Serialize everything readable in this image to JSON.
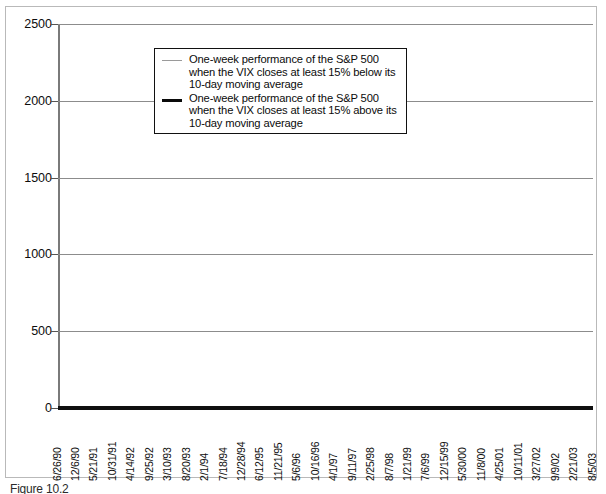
{
  "figure": {
    "caption": "Figure 10.2"
  },
  "legend": {
    "position": "top-left-inside",
    "items": [
      {
        "key": "below",
        "style": "thin-gray",
        "label": "One-week performance of the S&P 500 when the VIX closes at least 15% below its 10-day moving average",
        "lines": [
          "One-week performance of the S&P 500",
          "when the VIX closes at least 15% below its",
          "10-day moving average"
        ]
      },
      {
        "key": "above",
        "style": "thick-black",
        "label": "One-week performance of the S&P 500 when the VIX closes at least 15% above its 10-day moving average",
        "lines": [
          "One-week performance of the S&P 500",
          "when the VIX closes at least 15% above its",
          "10-day moving average"
        ]
      }
    ]
  },
  "colors": {
    "series_above": "#0a0a0a",
    "series_below": "#9a9a9a",
    "gridline": "#8c8c8c",
    "axis": "#101010",
    "background": "#ffffff"
  },
  "chart_data": {
    "type": "line",
    "title": "",
    "subtitle": "",
    "xlabel": "",
    "ylabel": "",
    "ylim": [
      0,
      2500
    ],
    "yticks": [
      0,
      500,
      1000,
      1500,
      2000,
      2500
    ],
    "ytick_labels": [
      "0",
      "500",
      "1000",
      "1500",
      "2000",
      "2500"
    ],
    "grid": true,
    "grid_axis": "y",
    "legend_position": "upper left (inside plot)",
    "x_tick_labels": [
      "6/26/90",
      "12/6/90",
      "5/21/91",
      "10/31/91",
      "4/14/92",
      "9/25/92",
      "3/10/93",
      "8/20/93",
      "2/1/94",
      "7/18/94",
      "12/28/94",
      "6/12/95",
      "11/21/95",
      "5/6/96",
      "10/16/96",
      "4/1/97",
      "9/11/97",
      "2/25/98",
      "8/7/98",
      "1/21/99",
      "7/6/99",
      "12/15/99",
      "5/30/00",
      "11/8/00",
      "4/25/01",
      "10/11/01",
      "3/27/02",
      "9/9/02",
      "2/21/03",
      "8/5/03"
    ],
    "series": [
      {
        "name": "One-week performance of the S&P 500 when the VIX closes at least 15% above its 10-day moving average",
        "style": "thick-black",
        "color": "#0a0a0a",
        "line_width": 2.4,
        "shape": "step",
        "start_value": 1000,
        "end_value": 2180,
        "max_value": 2255,
        "min_value": 975,
        "x": [
          0.0,
          0.8,
          1.2,
          1.6,
          2.0,
          2.4,
          2.8,
          3.2,
          3.6,
          4.0,
          4.6,
          5.2,
          5.8,
          6.4,
          7.0,
          7.6,
          8.2,
          8.8,
          9.4,
          10.0,
          10.6,
          11.2,
          11.8,
          12.4,
          13.0,
          13.6,
          14.2,
          14.8,
          15.4,
          16.0,
          16.4,
          16.8,
          17.0,
          17.2,
          17.4,
          17.6,
          17.8,
          18.0,
          18.2,
          18.5,
          19.0,
          19.5,
          20.0,
          20.5,
          21.0,
          21.5,
          22.0,
          22.5,
          23.0,
          23.4,
          23.6,
          23.8,
          24.0,
          24.4,
          25.0,
          25.6,
          26.0,
          26.2,
          26.4,
          26.6,
          27.0,
          27.6,
          28.2,
          28.8,
          29.0
        ],
        "y": [
          1000,
          1000,
          1045,
          1075,
          1090,
          1110,
          1140,
          1225,
          1235,
          1240,
          1300,
          1310,
          1315,
          1370,
          1380,
          1400,
          1440,
          1470,
          1500,
          1525,
          1545,
          1575,
          1585,
          1600,
          1610,
          1625,
          1640,
          1665,
          1680,
          1700,
          1790,
          1900,
          2000,
          2030,
          1975,
          2040,
          1860,
          2010,
          1900,
          1950,
          1960,
          1965,
          1990,
          2010,
          2050,
          2080,
          2120,
          2130,
          2160,
          2190,
          2230,
          2255,
          2230,
          2230,
          1860,
          1930,
          1925,
          1890,
          1750,
          1990,
          2040,
          2090,
          2105,
          2160,
          2180
        ]
      },
      {
        "name": "One-week performance of the S&P 500 when the VIX closes at least 15% below its 10-day moving average",
        "style": "thin-gray",
        "color": "#9a9a9a",
        "line_width": 1,
        "shape": "step",
        "start_value": 1000,
        "end_value": 930,
        "max_value": 1030,
        "min_value": 870,
        "x": [
          0.0,
          0.6,
          1.0,
          1.4,
          1.8,
          2.2,
          2.6,
          3.0,
          3.6,
          4.4,
          5.4,
          6.6,
          8.0,
          9.4,
          10.8,
          12.0,
          13.0,
          14.0,
          15.0,
          16.0,
          16.6,
          17.2,
          17.8,
          18.4,
          19.0,
          19.6,
          20.2,
          20.8,
          21.4,
          22.0,
          22.4,
          22.8,
          23.2,
          23.6,
          24.0,
          24.4,
          25.0,
          25.6,
          26.0,
          26.2,
          26.6,
          27.2,
          27.8,
          28.4,
          29.0
        ],
        "y": [
          1000,
          1000,
          985,
          945,
          950,
          955,
          1030,
          1025,
          1000,
          998,
          996,
          994,
          992,
          990,
          990,
          988,
          988,
          990,
          995,
          998,
          1000,
          1000,
          1010,
          1012,
          1012,
          1014,
          1020,
          1022,
          1020,
          1022,
          985,
          975,
          975,
          960,
          958,
          940,
          938,
          940,
          940,
          870,
          935,
          935,
          932,
          930,
          930
        ]
      }
    ]
  }
}
